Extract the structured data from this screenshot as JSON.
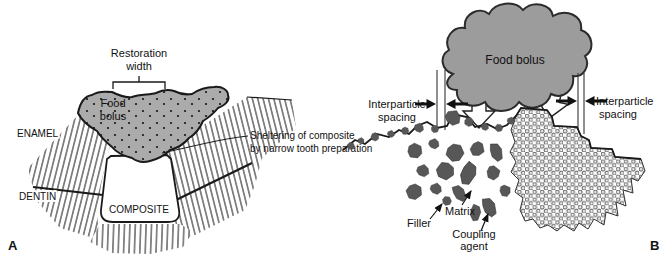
{
  "figure": {
    "colors": {
      "outline": "#1a1a1a",
      "bolus_fill": "#ababab",
      "cloud_fill": "#9c9c9c",
      "filler_fill": "#575757",
      "micro_ring": "#444444"
    },
    "panel_a": {
      "panel_label": "A",
      "restoration_width_line1": "Restoration",
      "restoration_width_line2": "width",
      "food_bolus_line1": "Food",
      "food_bolus_line2": "bolus",
      "enamel_label": "ENAMEL",
      "dentin_label": "DENTIN",
      "composite_label": "COMPOSITE",
      "sheltering_line1": "Sheltering of composite",
      "sheltering_line2": "by narrow tooth preparation"
    },
    "panel_b": {
      "panel_label": "B",
      "food_bolus_label": "Food bolus",
      "interparticle_left_line1": "Interparticle",
      "interparticle_left_line2": "spacing",
      "interparticle_right_line1": "Interparticle",
      "interparticle_right_line2": "spacing",
      "filler_label": "Filler",
      "matrix_label": "Matrix",
      "coupling_agent_line1": "Coupling",
      "coupling_agent_line2": "agent"
    }
  }
}
